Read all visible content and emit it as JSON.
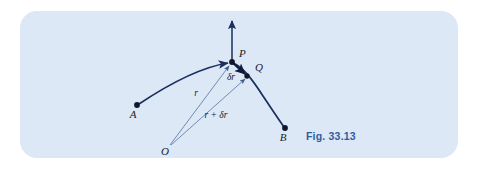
{
  "figure": {
    "caption": "Fig. 33.13",
    "panel_color": "#dce8f5",
    "curve_color": "#1b2f5e",
    "radius_color": "#5b78a8",
    "caption_color": "#2f5d9e",
    "points": [
      {
        "id": "A",
        "label": "A",
        "x": 137,
        "y": 105,
        "label_x": 133,
        "label_y": 118
      },
      {
        "id": "P",
        "label": "P",
        "x": 232,
        "y": 62,
        "label_x": 239,
        "label_y": 57
      },
      {
        "id": "Q",
        "label": "Q",
        "x": 248,
        "y": 76,
        "label_x": 255,
        "label_y": 71
      },
      {
        "id": "B",
        "label": "B",
        "x": 285,
        "y": 128,
        "label_x": 282,
        "label_y": 141
      },
      {
        "id": "O",
        "label": "O",
        "x": 169,
        "y": 146,
        "label_x": 164,
        "label_y": 154
      }
    ],
    "segments": [
      {
        "id": "r",
        "label": "r",
        "from": "O",
        "to": "P",
        "label_x": 196,
        "label_y": 96
      },
      {
        "id": "r-plus-dr",
        "label": "r + δr",
        "from": "O",
        "to": "Q",
        "label_x": 213,
        "label_y": 117
      },
      {
        "id": "dr",
        "label": "δr",
        "from": "P",
        "to": "Q",
        "label_x": 231,
        "label_y": 79
      }
    ],
    "vertical_arrow": {
      "id": "velocity-arrow",
      "from_x": 232,
      "from_y": 62,
      "to_x": 232,
      "to_y": 18
    },
    "trajectory": {
      "id": "trajectory-curve",
      "start": "A",
      "apex": "P",
      "end": "B"
    }
  }
}
